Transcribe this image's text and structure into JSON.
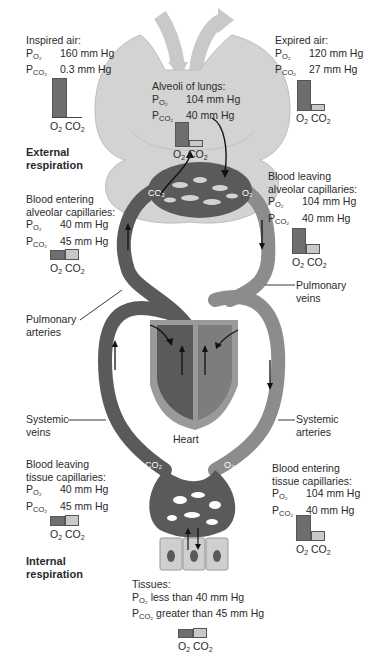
{
  "inspired_air": {
    "title": "Inspired air:",
    "po2": "160 mm Hg",
    "pco2": "0.3 mm Hg"
  },
  "expired_air": {
    "title": "Expired air:",
    "po2": "120 mm Hg",
    "pco2": "27 mm Hg"
  },
  "alveoli": {
    "title": "Alveoli of lungs:",
    "po2": "104 mm Hg",
    "pco2": "40 mm Hg"
  },
  "external_respiration": {
    "line1": "External",
    "line2": "respiration"
  },
  "blood_leaving_alveolar": {
    "line1": "Blood leaving",
    "line2": "alveolar capillaries:",
    "po2": "104 mm Hg",
    "pco2": "40 mm Hg"
  },
  "blood_entering_alveolar": {
    "line1": "Blood entering",
    "line2": "alveolar capillaries:",
    "po2": "40 mm Hg",
    "pco2": "45 mm Hg"
  },
  "pulmonary_veins": {
    "line1": "Pulmonary",
    "line2": "veins"
  },
  "pulmonary_arteries": {
    "line1": "Pulmonary",
    "line2": "arteries"
  },
  "heart": {
    "label": "Heart"
  },
  "systemic_veins": {
    "line1": "Systemic",
    "line2": "veins"
  },
  "systemic_arteries": {
    "line1": "Systemic",
    "line2": "arteries"
  },
  "blood_leaving_tissue": {
    "line1": "Blood leaving",
    "line2": "tissue capillaries:",
    "po2": "40 mm Hg",
    "pco2": "45 mm Hg"
  },
  "blood_entering_tissue": {
    "line1": "Blood entering",
    "line2": "tissue capillaries:",
    "po2": "104 mm Hg",
    "pco2": "40 mm Hg"
  },
  "internal_respiration": {
    "line1": "Internal",
    "line2": "respiration"
  },
  "tissues": {
    "title": "Tissues:",
    "po2": "less than 40 mm Hg",
    "pco2": "greater than 45 mm Hg"
  },
  "symbols": {
    "p": "P",
    "o2_sub": "O2",
    "co2_sub": "CO2",
    "o2": "O",
    "co2": "CO",
    "two": "2"
  },
  "vessel_labels": {
    "co2": "CO2",
    "o2": "O2"
  },
  "colors": {
    "lung": "#d2d2d2",
    "deoxygenated_vessel": "#5a5a5a",
    "oxygenated_vessel": "#8c8c8c",
    "heart_outer": "#9a9a9a",
    "o2_bar": "#6e6e6e",
    "co2_bar": "#c8c8c8",
    "air_arrow": "#c4c4c4",
    "tissue_cell": "#cfcfcf"
  }
}
